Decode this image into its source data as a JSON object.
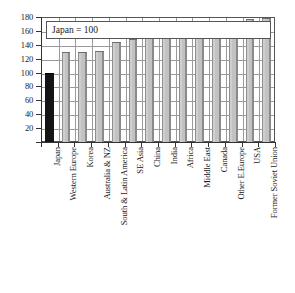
{
  "chart_data": {
    "type": "bar",
    "title": "",
    "subtitle": "",
    "annotation": "Japan = 100",
    "xlabel": "",
    "ylabel": "",
    "ylim": [
      0,
      180
    ],
    "yticks": [
      0,
      20,
      40,
      60,
      80,
      100,
      120,
      140,
      160,
      180
    ],
    "ytick_labels": [
      "",
      "20",
      "40",
      "60",
      "80",
      "100",
      "120",
      "140",
      "160",
      "180"
    ],
    "grid": true,
    "legend": "none",
    "baseline_category": "Japan",
    "categories": [
      "Japan",
      "Western Europe",
      "Korea",
      "Australia & NZ",
      "South & Latin America",
      "SE Asia",
      "China",
      "India",
      "Africa",
      "Middle East",
      "Canada",
      "Other E.Europe",
      "USA",
      "Former Soviet Union"
    ],
    "values": [
      100,
      130,
      130,
      131,
      144,
      149,
      152,
      152,
      153,
      158,
      159,
      167,
      177,
      178
    ],
    "bar_colors": [
      "#141414",
      "#c2c2c2",
      "#c2c2c2",
      "#c2c2c2",
      "#c2c2c2",
      "#c2c2c2",
      "#c2c2c2",
      "#c2c2c2",
      "#c2c2c2",
      "#c2c2c2",
      "#c2c2c2",
      "#c2c2c2",
      "#c2c2c2",
      "#c2c2c2"
    ]
  },
  "style": {
    "highlight_color": "#141414",
    "bar_color": "#c2c2c2",
    "grid_color": "#9a9a9a",
    "axis_color": "#333333",
    "background": "#ffffff"
  }
}
